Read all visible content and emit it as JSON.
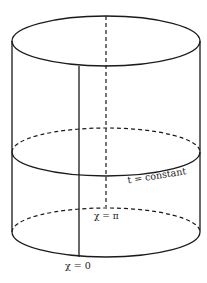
{
  "diagram": {
    "type": "cylinder-spacetime",
    "labels": {
      "t_constant": "t = constant",
      "chi_pi": "χ = π",
      "chi_zero": "χ = 0"
    },
    "stroke_color": "#1a1a1a",
    "background": "#ffffff"
  }
}
